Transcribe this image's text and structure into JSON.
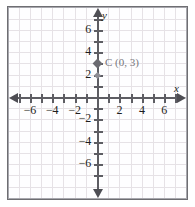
{
  "chart_data": {
    "type": "scatter",
    "title": "",
    "xlabel": "x",
    "ylabel": "y",
    "xlim": [
      -7.5,
      7.5
    ],
    "ylim": [
      -7.5,
      7.5
    ],
    "grid": true,
    "legend": "none",
    "x_tick_labels": [
      "-6",
      "-4",
      "-2",
      "2",
      "4",
      "6"
    ],
    "x_tick_values": [
      -6,
      -4,
      -2,
      2,
      4,
      6
    ],
    "y_tick_labels": [
      "6",
      "4",
      "2",
      "-2",
      "-4",
      "-6"
    ],
    "y_tick_values": [
      6,
      4,
      2,
      -2,
      -4,
      -6
    ],
    "minor_tick_step": 1,
    "points": [
      {
        "name": "C",
        "label": "C (0, 3)",
        "x": 0,
        "y": 3
      }
    ],
    "annotations": [
      {
        "label": "C (0, 3)",
        "x": 0.6,
        "y": 3
      }
    ]
  },
  "axes": {
    "x_name": "x",
    "y_name": "y"
  },
  "point": {
    "letter": "C",
    "label": "C (0, 3)",
    "x": 0,
    "y": 3
  },
  "colors": {
    "grid": "#e6e2e6",
    "axis": "#5d5d63",
    "frame": "#6e6e72",
    "point": "#6b6b71",
    "label": "#76767c",
    "tick_text": "#1d1d20",
    "background": "#ffffff"
  }
}
